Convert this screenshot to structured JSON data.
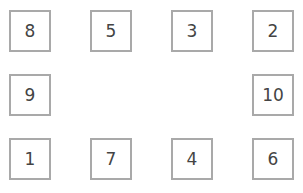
{
  "boxes": [
    {
      "label": "8",
      "x": 9,
      "y": 10
    },
    {
      "label": "5",
      "x": 90,
      "y": 10
    },
    {
      "label": "3",
      "x": 171,
      "y": 10
    },
    {
      "label": "2",
      "x": 252,
      "y": 10
    },
    {
      "label": "9",
      "x": 9,
      "y": 74
    },
    {
      "label": "10",
      "x": 252,
      "y": 74
    },
    {
      "label": "1",
      "x": 9,
      "y": 138
    },
    {
      "label": "7",
      "x": 90,
      "y": 138
    },
    {
      "label": "4",
      "x": 171,
      "y": 138
    },
    {
      "label": "6",
      "x": 252,
      "y": 138
    }
  ]
}
